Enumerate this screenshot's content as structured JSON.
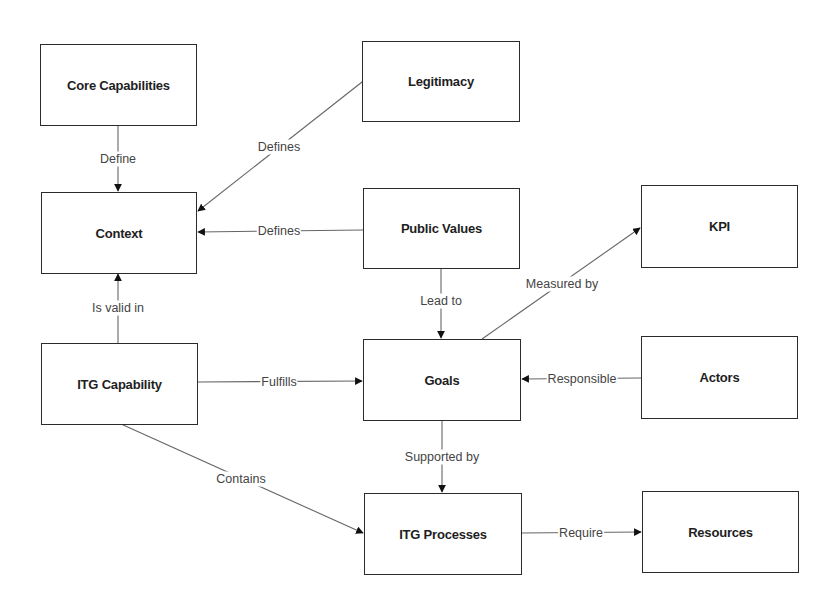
{
  "nodes": {
    "core_capabilities": "Core Capabilities",
    "legitimacy": "Legitimacy",
    "context": "Context",
    "public_values": "Public Values",
    "kpi": "KPI",
    "itg_capability": "ITG Capability",
    "goals": "Goals",
    "actors": "Actors",
    "itg_processes": "ITG Processes",
    "resources": "Resources"
  },
  "edges": {
    "core_to_context": "Define",
    "legitimacy_to_context": "Defines",
    "public_values_to_context": "Defines",
    "capability_to_context": "Is valid in",
    "public_values_to_goals": "Lead to",
    "goals_to_kpi": "Measured by",
    "capability_to_goals": "Fulfills",
    "actors_to_goals": "Responsible",
    "goals_to_processes": "Supported by",
    "capability_to_processes": "Contains",
    "processes_to_resources": "Require"
  },
  "colors": {
    "line": "#555555",
    "border": "#2b2b2b",
    "text": "#1e1e1e"
  }
}
